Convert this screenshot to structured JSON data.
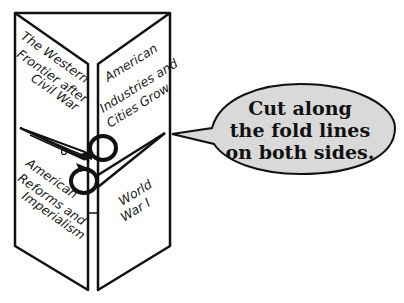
{
  "foldable": {
    "panels": [
      {
        "id": "top-left",
        "lines": [
          "The Western",
          "Frontier after",
          "Civil War"
        ]
      },
      {
        "id": "top-right",
        "lines": [
          "American",
          "Industries and",
          "Cities Grow"
        ]
      },
      {
        "id": "bottom-left",
        "lines": [
          "American",
          "Reforms and",
          "Imperialism"
        ]
      },
      {
        "id": "bottom-right",
        "lines": [
          "World",
          "War I"
        ]
      }
    ]
  },
  "callout": {
    "lines": [
      "Cut along",
      "the fold lines",
      "on both sides."
    ],
    "fill_color": "#d9d9d9"
  },
  "icons": [
    "scissors-icon"
  ]
}
